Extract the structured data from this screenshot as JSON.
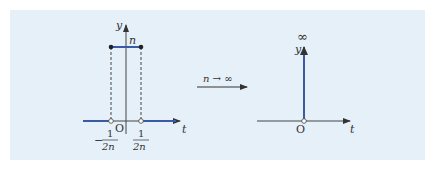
{
  "figure": {
    "background": "#e6f0f9",
    "accent_color": "#3a5aa8",
    "axis_color": "#444444",
    "left_plot": {
      "y_label": "y",
      "t_label": "t",
      "origin_label": "O",
      "height_label": "n",
      "left_bound": {
        "sign": "−",
        "numerator": "1",
        "denominator": "2n"
      },
      "right_bound": {
        "numerator": "1",
        "denominator": "2n"
      }
    },
    "transition": {
      "label": "n → ∞"
    },
    "right_plot": {
      "y_label": "y",
      "t_label": "t",
      "origin_label": "O",
      "impulse_label": "∞"
    }
  }
}
